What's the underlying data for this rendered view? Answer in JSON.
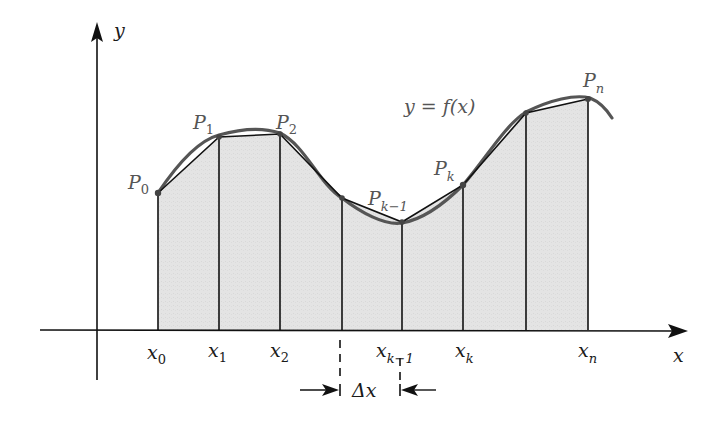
{
  "diagram": {
    "title": "",
    "axes": {
      "x_label": "x",
      "y_label": "y",
      "origin": [
        97,
        330
      ]
    },
    "curve_label": "y = f(x)",
    "colors": {
      "fill": "#e3e3e3",
      "curve": "#555555",
      "polygon": "#111111",
      "axes": "#111111",
      "point_label": "#555555"
    },
    "partition_points": [
      {
        "x_label": "x",
        "x_sub": "0",
        "p_label": "P",
        "p_sub": "0",
        "px": 158,
        "py": 193
      },
      {
        "x_label": "x",
        "x_sub": "1",
        "p_label": "P",
        "p_sub": "1",
        "px": 219,
        "py": 137
      },
      {
        "x_label": "x",
        "x_sub": "2",
        "p_label": "P",
        "p_sub": "2",
        "px": 280,
        "py": 134
      },
      {
        "x_label": "",
        "x_sub": "",
        "p_label": "",
        "p_sub": "",
        "px": 342,
        "py": 198
      },
      {
        "x_label": "x",
        "x_sub": "k−1",
        "p_label": "P",
        "p_sub": "k−1",
        "px": 402,
        "py": 222
      },
      {
        "x_label": "x",
        "x_sub": "k",
        "p_label": "P",
        "p_sub": "k",
        "px": 463,
        "py": 185
      },
      {
        "x_label": "",
        "x_sub": "",
        "p_label": "",
        "p_sub": "",
        "px": 526,
        "py": 113
      },
      {
        "x_label": "x",
        "x_sub": "n",
        "p_label": "P",
        "p_sub": "n",
        "px": 588,
        "py": 99
      }
    ],
    "delta": {
      "label": "Δx",
      "from_x": 342,
      "to_x": 402
    }
  },
  "labels": {
    "y_axis": "y",
    "x_axis": "x",
    "fx": "y = f(x)",
    "x0": "x",
    "x0_sub": "0",
    "x1": "x",
    "x1_sub": "1",
    "x2": "x",
    "x2_sub": "2",
    "xk1": "x",
    "xk1_sub": "k−1",
    "xk": "x",
    "xk_sub": "k",
    "xn": "x",
    "xn_sub": "n",
    "p0": "P",
    "p0_sub": "0",
    "p1": "P",
    "p1_sub": "1",
    "p2": "P",
    "p2_sub": "2",
    "pk1": "P",
    "pk1_sub": "k−1",
    "pk": "P",
    "pk_sub": "k",
    "pn": "P",
    "pn_sub": "n",
    "delta_x": "Δx"
  }
}
